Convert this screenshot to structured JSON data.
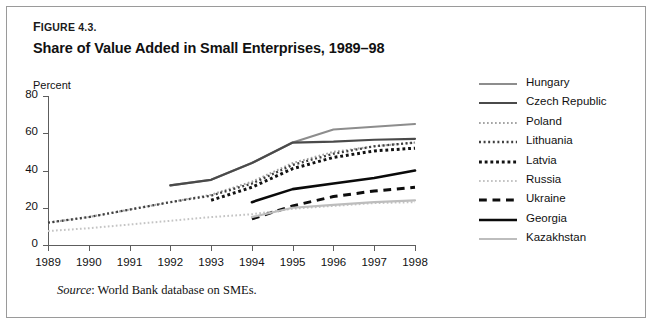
{
  "figure": {
    "label_small": "IGURE",
    "label_first": "F",
    "label_number": "4.3.",
    "title": "Share of Value Added in Small Enterprises, 1989–98",
    "source_prefix": "Source",
    "source_text": ": World Bank database on SMEs."
  },
  "chart_data": {
    "type": "line",
    "title": "Share of Value Added in Small Enterprises, 1989–98",
    "xlabel": "",
    "ylabel": "Percent",
    "ylim": [
      0,
      80
    ],
    "yticks": [
      0,
      20,
      40,
      60,
      80
    ],
    "xticks": [
      1989,
      1990,
      1991,
      1992,
      1993,
      1994,
      1995,
      1996,
      1997,
      1998
    ],
    "x": [
      1989,
      1990,
      1991,
      1992,
      1993,
      1994,
      1995,
      1996,
      1997,
      1998
    ],
    "grid": false,
    "legend_position": "right",
    "series": [
      {
        "name": "Hungary",
        "color": "#8d8d8d",
        "style": "solid",
        "width": 2.1,
        "x": [
          1992,
          1993,
          1994,
          1995,
          1996,
          1997,
          1998
        ],
        "values": [
          32,
          35,
          44,
          55,
          62,
          63.5,
          65
        ]
      },
      {
        "name": "Czech Republic",
        "color": "#4a4a4a",
        "style": "solid",
        "width": 2.2,
        "x": [
          1992,
          1993,
          1994,
          1995,
          1996,
          1997,
          1998
        ],
        "values": [
          32,
          35,
          44,
          55,
          55.5,
          56.5,
          57
        ]
      },
      {
        "name": "Poland",
        "color": "#a5a5a5",
        "style": "dotted-fine",
        "width": 2.0,
        "x": [
          1989,
          1990,
          1991,
          1992,
          1993,
          1994,
          1995,
          1996,
          1997,
          1998
        ],
        "values": [
          12,
          15,
          19,
          23,
          27,
          34,
          44,
          50,
          53,
          55
        ]
      },
      {
        "name": "Lithuania",
        "color": "#3f3f3f",
        "style": "dotted-fine",
        "width": 2.3,
        "x": [
          1989,
          1990,
          1991,
          1992,
          1993,
          1994,
          1995,
          1996,
          1997,
          1998
        ],
        "values": [
          12,
          15,
          19,
          23,
          26.5,
          33,
          43,
          49,
          53,
          55
        ]
      },
      {
        "name": "Latvia",
        "color": "#121212",
        "style": "dotted-bold",
        "width": 3.0,
        "x": [
          1993,
          1994,
          1995,
          1996,
          1997,
          1998
        ],
        "values": [
          24,
          31,
          41,
          47,
          50.5,
          52
        ]
      },
      {
        "name": "Russia",
        "color": "#c4c4c4",
        "style": "dotted-fine",
        "width": 2.0,
        "x": [
          1989,
          1990,
          1991,
          1992,
          1993,
          1994,
          1995,
          1996,
          1997,
          1998
        ],
        "values": [
          7.5,
          9,
          11,
          13,
          15,
          16.5,
          19.5,
          21,
          22.5,
          23
        ]
      },
      {
        "name": "Ukraine",
        "color": "#0d0d0d",
        "style": "dashed",
        "width": 3.0,
        "x": [
          1994,
          1995,
          1996,
          1997,
          1998
        ],
        "values": [
          14,
          21,
          26,
          29,
          31
        ]
      },
      {
        "name": "Georgia",
        "color": "#0a0a0a",
        "style": "solid",
        "width": 2.6,
        "x": [
          1994,
          1995,
          1996,
          1997,
          1998
        ],
        "values": [
          23,
          30,
          33,
          36,
          40
        ]
      },
      {
        "name": "Kazakhstan",
        "color": "#bdbdbd",
        "style": "solid",
        "width": 2.2,
        "x": [
          1994,
          1995,
          1996,
          1997,
          1998
        ],
        "values": [
          15,
          20,
          21.5,
          23,
          24
        ]
      }
    ]
  }
}
